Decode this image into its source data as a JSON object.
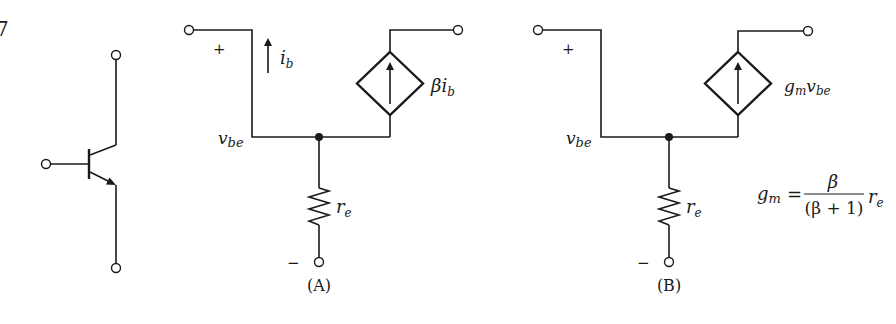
{
  "figure": {
    "number_fragment": "7",
    "transistor": {
      "name": "bjt-npn-symbol",
      "terminals": [
        "base",
        "collector",
        "emitter"
      ]
    },
    "circuit_a": {
      "caption": "(A)",
      "plus_label": "+",
      "minus_label": "−",
      "input_voltage_label": {
        "main": "v",
        "sub": "be"
      },
      "base_current_label": {
        "main": "i",
        "sub": "b"
      },
      "source_label": {
        "prefix": "β",
        "main": "i",
        "sub": "b"
      },
      "resistor_label": {
        "main": "r",
        "sub": "e"
      }
    },
    "circuit_b": {
      "caption": "(B)",
      "plus_label": "+",
      "minus_label": "−",
      "input_voltage_label": {
        "main": "v",
        "sub": "be"
      },
      "source_label": {
        "g": "g",
        "g_sub": "m",
        "v": "v",
        "v_sub": "be"
      },
      "resistor_label": {
        "main": "r",
        "sub": "e"
      },
      "equation": {
        "lhs": "g",
        "lhs_sub": "m",
        "equals": "=",
        "numerator": "β",
        "denominator": "(β + 1)",
        "rhs": "r",
        "rhs_sub": "e"
      }
    }
  }
}
